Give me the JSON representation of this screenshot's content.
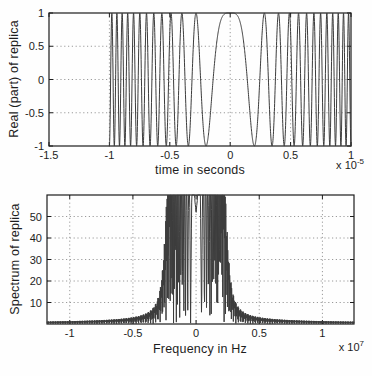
{
  "figure": {
    "background": "#fefefe",
    "line_color": "#3c3c3c",
    "axis_color": "#1c1c1c",
    "grid_color": "#8f8f8f",
    "text_color": "#1d1d1d"
  },
  "chart_data": [
    {
      "type": "line",
      "title": "",
      "xlabel": "time in seconds",
      "ylabel": "Real (part) of replica",
      "x_scale": {
        "prefix": "x 10",
        "exponent": "-5"
      },
      "xlim": [
        -1.5,
        1
      ],
      "ylim": [
        -1,
        1
      ],
      "xtick_values": [
        -1.5,
        -1,
        -0.5,
        0,
        0.5,
        1
      ],
      "xtick_labels": [
        "-1.5",
        "-1",
        "-0.5",
        "0",
        "0.5",
        "1"
      ],
      "ytick_values": [
        -1,
        -0.5,
        0,
        0.5,
        1
      ],
      "ytick_labels": [
        "-1",
        "-0.5",
        "0",
        "0.5",
        "1"
      ],
      "grid": true,
      "legend": null,
      "series": [
        {
          "name": "LFM chirp replica (real part)",
          "kind": "lfm_chirp_cos",
          "amplitude": 1,
          "t_start": -1,
          "t_end": 1,
          "quadratic_phase_pi_coeff": 25,
          "formula": "y = cos(25*pi*u^2), u = t/1e-5 in [-1,1]; 12.5 cycles per half-duration"
        }
      ]
    },
    {
      "type": "line",
      "title": "",
      "xlabel": "Frequency in Hz",
      "ylabel": "Spectrum of replica",
      "x_scale": {
        "prefix": "x 10",
        "exponent": "7"
      },
      "xlim": [
        -1.18,
        1.25
      ],
      "ylim": [
        0,
        60
      ],
      "xtick_values": [
        -1,
        -0.5,
        0,
        0.5,
        1
      ],
      "xtick_labels": [
        "-1",
        "-0.5",
        "0",
        "0.5",
        "1"
      ],
      "ytick_values": [
        10,
        20,
        30,
        40,
        50
      ],
      "ytick_labels": [
        "10",
        "20",
        "30",
        "40",
        "50"
      ],
      "grid": true,
      "legend": null,
      "series": [
        {
          "name": "Magnitude spectrum of replica",
          "kind": "chirp_spectrum_magnitude",
          "flat_level": 50,
          "band_edge": 0.25,
          "approx_peak": 59,
          "visible_sidelobe_extent": 0.7,
          "description": "Approximately flat at 50 with dense Fresnel ripples for |f| < 0.25e7 Hz, edge spikes near 59 at about +/-0.21e7 Hz, steep rolloff reaching ~0 by |f| = 0.4e7 Hz"
        }
      ]
    }
  ]
}
